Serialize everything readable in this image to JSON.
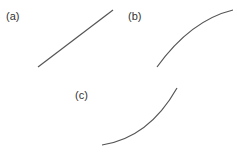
{
  "panels": [
    {
      "label": "(a)",
      "shape": "straight-line",
      "description": "linear increasing"
    },
    {
      "label": "(b)",
      "shape": "concave-down-curve",
      "description": "increasing, decelerating"
    },
    {
      "label": "(c)",
      "shape": "concave-up-curve",
      "description": "increasing, accelerating"
    }
  ],
  "colors": {
    "line": "#555555",
    "text": "#333333",
    "background": "#ffffff"
  }
}
